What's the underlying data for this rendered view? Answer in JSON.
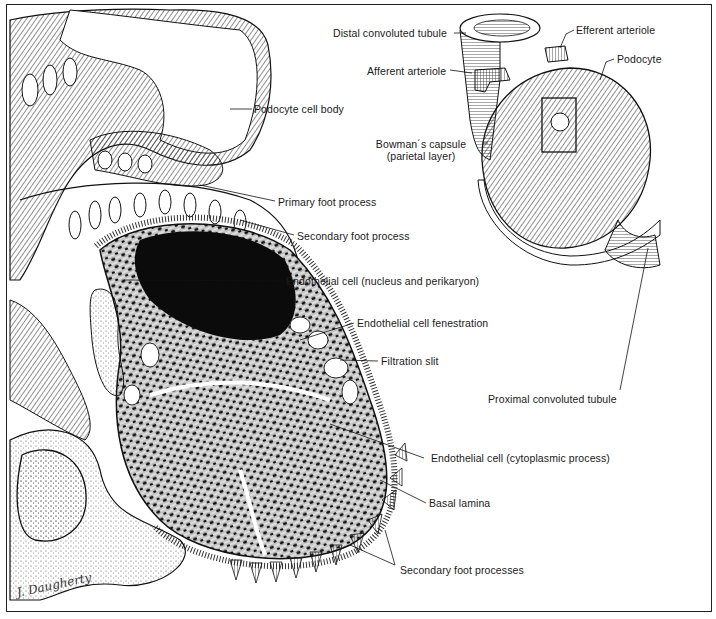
{
  "figure": {
    "artist_signature": "J. Daugherty",
    "colors": {
      "ink": "#1a1a1a",
      "paper": "#ffffff"
    }
  },
  "labels": {
    "distal_convoluted_tubule": "Distal convoluted tubule",
    "efferent_arteriole": "Efferent arteriole",
    "afferent_arteriole": "Afferent arteriole",
    "podocyte": "Podocyte",
    "podocyte_cell_body": "Podocyte cell body",
    "bowmans_capsule_line1": "Bowman´s capsule",
    "bowmans_capsule_line2": "(parietal layer)",
    "primary_foot_process": "Primary foot process",
    "secondary_foot_process": "Secondary foot process",
    "endothelial_nucleus": "Endothelial cell (nucleus and perikaryon)",
    "endothelial_fenestration": "Endothelial cell fenestration",
    "filtration_slit": "Filtration slit",
    "proximal_convoluted_tubule": "Proximal convoluted tubule",
    "endothelial_cytoplasmic": "Endothelial cell (cytoplasmic process)",
    "basal_lamina": "Basal lamina",
    "secondary_foot_processes": "Secondary foot processes"
  }
}
